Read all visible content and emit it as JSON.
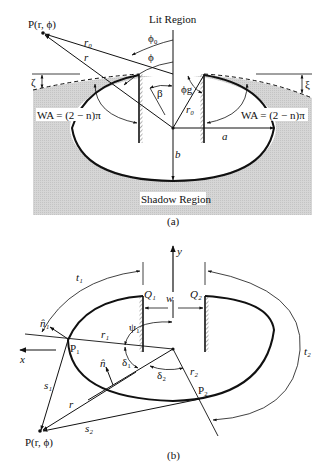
{
  "figure": {
    "part_a": {
      "caption": "(a)",
      "lit_region": "Lit Region",
      "shadow_region": "Shadow Region",
      "point_label": "P(r, ϕ)",
      "wa_left": "WA = (2 − n)π",
      "wa_right": "WA = (2 − n)π",
      "labels": {
        "r0_top": "r₀",
        "r": "r",
        "phi0": "ϕ₀",
        "phi": "ϕ",
        "beta": "β",
        "phi_g": "ϕg",
        "r0_inner": "r₀",
        "zeta_left": "ζ",
        "xi_right": "ξ",
        "a": "a",
        "b": "b"
      }
    },
    "part_b": {
      "caption": "(b)",
      "point_label": "P(r, ϕ)",
      "labels": {
        "y": "y",
        "x": "x",
        "w": "w",
        "Q1": "Q₁",
        "Q2": "Q₂",
        "t1": "t₁",
        "t2": "t₂",
        "n1": "n̂₁",
        "n": "n̂",
        "P1": "P₁",
        "P2": "P₂",
        "r1": "r₁",
        "r2": "r₂",
        "psi1": "ψ₁",
        "delta1": "δ₁",
        "delta2": "δ₂",
        "s1": "s₁",
        "s2": "s₂",
        "r": "r"
      }
    },
    "colors": {
      "ink": "#111111",
      "shade": "#d4d4d4",
      "background": "#ffffff"
    }
  }
}
